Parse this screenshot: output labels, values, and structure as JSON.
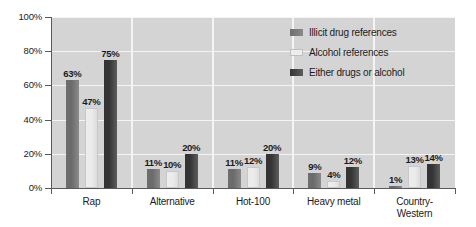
{
  "chart_data": {
    "type": "bar",
    "title": "",
    "xlabel": "",
    "ylabel": "",
    "ylim": [
      0,
      100
    ],
    "ytick_labels": [
      "0%",
      "20%",
      "40%",
      "60%",
      "80%",
      "100%"
    ],
    "ytick_values": [
      0,
      20,
      40,
      60,
      80,
      100
    ],
    "grid": true,
    "legend_position": "upper right",
    "categories": [
      "Rap",
      "Alternative",
      "Hot-100",
      "Heavy metal",
      "Country-Western"
    ],
    "category_lines": [
      [
        "Rap"
      ],
      [
        "Alternative"
      ],
      [
        "Hot-100"
      ],
      [
        "Heavy metal"
      ],
      [
        "Country-",
        "Western"
      ]
    ],
    "series": [
      {
        "name": "Illicit drug references",
        "color": "#6e6e6e",
        "values": [
          63,
          11,
          11,
          9,
          1
        ],
        "labels": [
          "63%",
          "11%",
          "11%",
          "9%",
          "1%"
        ]
      },
      {
        "name": "Alcohol references",
        "color": "#ededed",
        "values": [
          47,
          10,
          12,
          4,
          13
        ],
        "labels": [
          "47%",
          "10%",
          "12%",
          "4%",
          "13%"
        ]
      },
      {
        "name": "Either drugs or alcohol",
        "color": "#333333",
        "values": [
          75,
          20,
          20,
          12,
          14
        ],
        "labels": [
          "75%",
          "20%",
          "20%",
          "12%",
          "14%"
        ]
      }
    ]
  },
  "colors": {
    "plot_background": "#d4d4d4",
    "gridline": "#f4f4f4",
    "axis": "#5a5a5a",
    "text": "#1c1c1c",
    "page_background": "#ffffff"
  }
}
